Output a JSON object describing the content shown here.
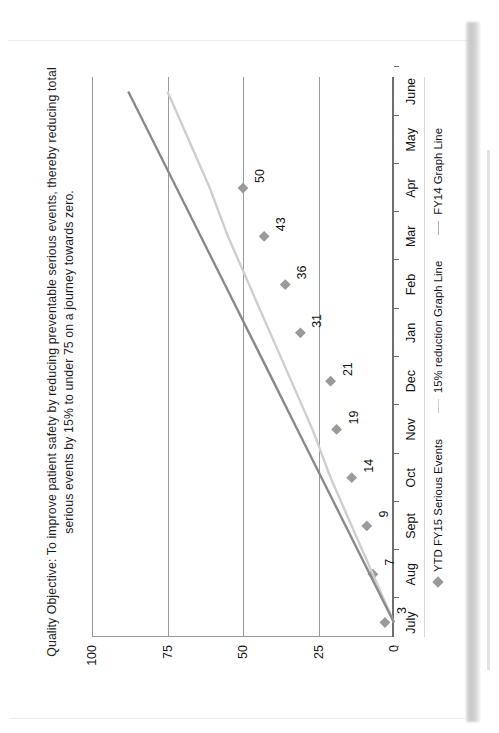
{
  "document": {
    "type": "scanned-page",
    "orientation": "landscape-chart-on-portrait-page"
  },
  "chart_data": {
    "type": "scatter",
    "title": "Quality Objective: To improve patient safety by reducing preventable serious events, thereby reducing total serious events by 15% to under 75 on a journey towards zero.",
    "xlabel": "",
    "ylabel": "",
    "ylim": [
      0,
      100
    ],
    "yticks": [
      0,
      25,
      50,
      75,
      100
    ],
    "ytick_labels": [
      "0",
      "25",
      "50",
      "75",
      "100"
    ],
    "grid": true,
    "grid_axis": "y",
    "legend_position": "bottom",
    "categories": [
      "July",
      "Aug",
      "Sept",
      "Oct",
      "Nov",
      "Dec",
      "Jan",
      "Feb",
      "Mar",
      "Apr",
      "May",
      "June"
    ],
    "series": [
      {
        "name": "YTD FY15 Serious Events",
        "marker": "diamond",
        "color": "#9a9a9a",
        "values": [
          3,
          7,
          9,
          14,
          19,
          21,
          31,
          36,
          43,
          50,
          null,
          null
        ],
        "data_labels": [
          "3",
          "7",
          "9",
          "14",
          "19",
          "21",
          "31",
          "36",
          "43",
          "50"
        ]
      },
      {
        "name": "15% reduction Graph Line",
        "marker": "line",
        "color": "#cfcfcf",
        "values": [
          0,
          7,
          14,
          21,
          27,
          34,
          41,
          48,
          55,
          61,
          68,
          75
        ]
      },
      {
        "name": "FY14 Graph Line",
        "marker": "line",
        "color": "#8a8a8a",
        "values": [
          0,
          8,
          16,
          24,
          32,
          40,
          48,
          56,
          64,
          72,
          80,
          88
        ]
      }
    ],
    "legend": [
      {
        "label": "YTD FY15 Serious Events",
        "symbol": "diamond",
        "color": "#9a9a9a"
      },
      {
        "label": "15% reduction Graph Line",
        "symbol": "dash",
        "color": "#cfcfcf"
      },
      {
        "label": "FY14 Graph Line",
        "symbol": "dash",
        "color": "#b0b0b0"
      }
    ]
  }
}
